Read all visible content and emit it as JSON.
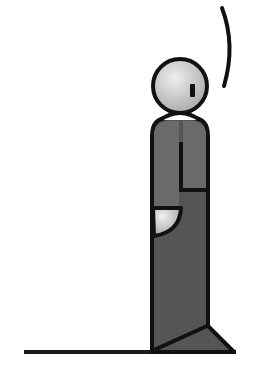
{
  "illustration": {
    "subject": "standing-figure",
    "colors": {
      "background": "#ffffff",
      "outline": "#111111",
      "head_fill": "#c9c9c9",
      "body_fill": "#555555",
      "upper_body_fill": "#6a6a6a",
      "hand_fill": "#d0d0d0",
      "ground": "#1a1a1a"
    }
  }
}
